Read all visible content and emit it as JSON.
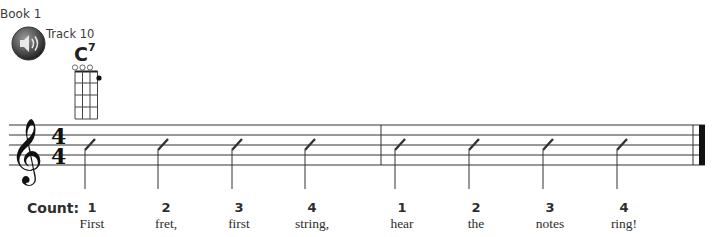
{
  "header": {
    "book": "Book 1",
    "track": "Track 10",
    "audio_icon": "speaker-icon"
  },
  "chord": {
    "name": "C",
    "extension": "7",
    "strings": 4,
    "frets": 4,
    "open_strings": [
      1,
      2,
      3
    ],
    "fingered": [
      {
        "string": 4,
        "fret": 1
      }
    ]
  },
  "staff": {
    "clef": "treble",
    "time_signature": {
      "top": "4",
      "bottom": "4"
    },
    "measures": 2,
    "notation": "slash"
  },
  "count": {
    "label": "Count:",
    "beats": [
      {
        "num": "1",
        "lyric": "First"
      },
      {
        "num": "2",
        "lyric": "fret,"
      },
      {
        "num": "3",
        "lyric": "first"
      },
      {
        "num": "4",
        "lyric": "string,"
      },
      {
        "num": "1",
        "lyric": "hear"
      },
      {
        "num": "2",
        "lyric": "the"
      },
      {
        "num": "3",
        "lyric": "notes"
      },
      {
        "num": "4",
        "lyric": "ring!"
      }
    ]
  }
}
